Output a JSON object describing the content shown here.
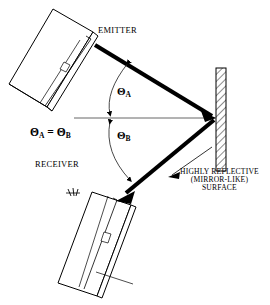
{
  "diagram": {
    "colors": {
      "stroke": "#000000",
      "background": "#ffffff",
      "beam": "#000000",
      "thin_line": "#555555"
    },
    "labels": {
      "emitter": "EMITTER",
      "receiver": "RECEIVER",
      "theta_a": "Θ",
      "theta_a_sub": "A",
      "theta_b": "Θ",
      "theta_b_sub": "B",
      "equation_left": "Θ",
      "equation_left_sub": "A",
      "equation_operator": "=",
      "equation_right": "Θ",
      "equation_right_sub": "B",
      "mirror_line1": "HIGHLY REFLECTIVE",
      "mirror_line2": "(MIRROR-LIKE)",
      "mirror_line3": "SURFACE"
    },
    "icons": {
      "emitter_device": "handheld-device-icon",
      "receiver_device": "handheld-device-icon",
      "radiation": "radiation-wave-icon",
      "mirror": "hatched-mirror-icon",
      "incident_beam": "incident-beam-arrow-icon",
      "reflected_beam": "reflected-beam-arrow-icon",
      "normal_line": "normal-reference-line-icon",
      "angle_arc_a": "angle-arc-icon",
      "angle_arc_b": "angle-arc-icon",
      "leader_line": "leader-line-icon"
    }
  }
}
